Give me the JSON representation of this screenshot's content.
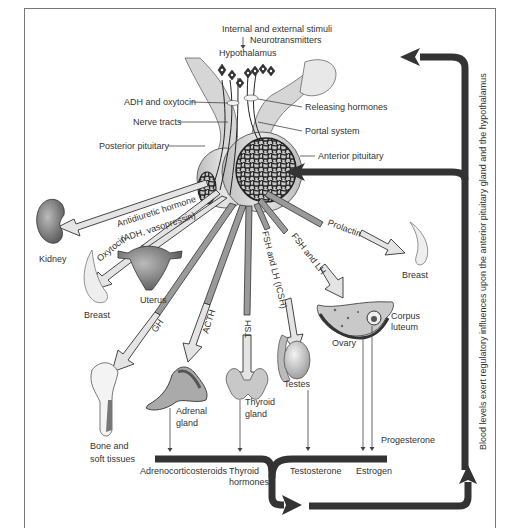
{
  "diagram": {
    "title_stimuli": "Internal and external stimuli",
    "neurotransmitters": "Neurotransmitters",
    "hypothalamus": "Hypothalamus",
    "left_labels": {
      "adh_oxytocin": "ADH and oxytocin",
      "nerve_tracts": "Nerve tracts",
      "posterior_pituitary": "Posterior pituitary"
    },
    "right_labels": {
      "releasing_hormones": "Releasing hormones",
      "portal_system": "Portal system",
      "anterior_pituitary": "Anterior pituitary"
    },
    "hormones": {
      "antidiuretic_1": "Antidiuretic hormone",
      "antidiuretic_2": "(ADH, vasopressin)",
      "oxytocin": "Oxytocin",
      "gh": "GH",
      "acth": "ACTH",
      "tsh": "TSH",
      "fsh_lh_icsh": "FSH and LH (ICSH)",
      "fsh_lh": "FSH and LH",
      "prolactin": "Prolactin"
    },
    "targets": {
      "kidney": "Kidney",
      "breast_left": "Breast",
      "uterus": "Uterus",
      "breast_right": "Breast",
      "bone_1": "Bone and",
      "bone_2": "soft tissues",
      "adrenal_1": "Adrenal",
      "adrenal_2": "gland",
      "thyroid_1": "Thyroid",
      "thyroid_2": "gland",
      "testes": "Testes",
      "ovary": "Ovary",
      "corpus_1": "Corpus",
      "corpus_2": "luteum"
    },
    "secreted": {
      "adrenocorticosteroids": "Adrenocorticosteroids",
      "thyroid_hormones_1": "Thyroid",
      "thyroid_hormones_2": "hormones",
      "testosterone": "Testosterone",
      "estrogen": "Estrogen",
      "progesterone": "Progesterone"
    },
    "feedback_caption": "Blood levels exert regulatory influences upon the anterior pituitary gland and the hypothalamus"
  }
}
